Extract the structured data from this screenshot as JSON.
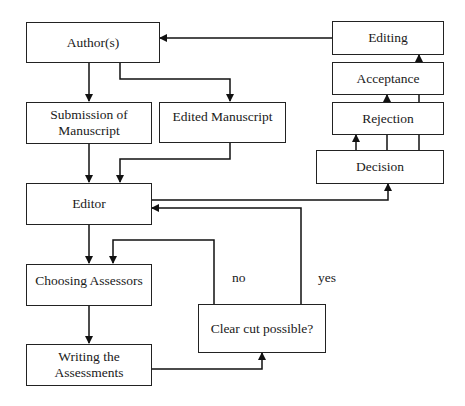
{
  "diagram": {
    "type": "flowchart",
    "nodes": {
      "authors": "Author(s)",
      "submission_line1": "Submission of",
      "submission_line2": "Manuscript",
      "edited_manuscript": "Edited Manuscript",
      "editor": "Editor",
      "choosing_assessors": "Choosing Assessors",
      "writing_line1": "Writing the",
      "writing_line2": "Assessments",
      "clear_cut": "Clear cut possible?",
      "editing": "Editing",
      "acceptance": "Acceptance",
      "rejection": "Rejection",
      "decision": "Decision"
    },
    "edge_labels": {
      "no": "no",
      "yes": "yes"
    },
    "edges": [
      {
        "from": "Author(s)",
        "to": "Submission of Manuscript"
      },
      {
        "from": "Author(s)",
        "to": "Edited Manuscript"
      },
      {
        "from": "Submission of Manuscript",
        "to": "Editor"
      },
      {
        "from": "Edited Manuscript",
        "to": "Editor"
      },
      {
        "from": "Editor",
        "to": "Decision"
      },
      {
        "from": "Editor",
        "to": "Choosing Assessors"
      },
      {
        "from": "Choosing Assessors",
        "to": "Writing the Assessments"
      },
      {
        "from": "Writing the Assessments",
        "to": "Clear cut possible?"
      },
      {
        "from": "Clear cut possible?",
        "to": "Choosing Assessors",
        "label": "no"
      },
      {
        "from": "Clear cut possible?",
        "to": "Editor",
        "label": "yes"
      },
      {
        "from": "Decision",
        "to": "Rejection"
      },
      {
        "from": "Decision",
        "to": "Acceptance"
      },
      {
        "from": "Decision",
        "to": "Editing"
      },
      {
        "from": "Editing",
        "to": "Author(s)"
      }
    ]
  }
}
